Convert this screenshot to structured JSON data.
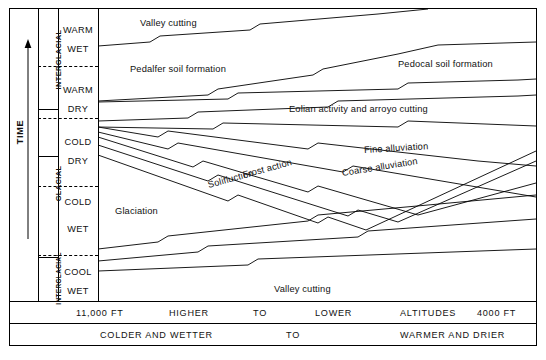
{
  "figure": {
    "vertical_axis_label": "TIME",
    "vertical_axis_direction": "up"
  },
  "time_column": {
    "label": "TIME",
    "arrow_icon": "up-arrow-icon"
  },
  "stage_column": {
    "stages": [
      {
        "label": "INTERGLACIAL",
        "top": 9,
        "height": 100
      },
      {
        "label": "GLACIAL",
        "top": 109,
        "height": 148
      },
      {
        "label": "INTERGLACIAL",
        "top": 257,
        "height": 44
      }
    ]
  },
  "climate_column": {
    "cells": [
      {
        "line1": "WARM",
        "line2": "WET",
        "top": 9,
        "height": 48
      },
      {
        "line1": "WARM",
        "line2": "DRY",
        "top": 57,
        "height": 52
      },
      {
        "line1": "COLD",
        "line2": "DRY",
        "top": 109,
        "height": 47
      },
      {
        "line1": "COLD",
        "line2": "WET",
        "top": 156,
        "height": 77
      },
      {
        "line1": "COOL",
        "line2": "WET",
        "top": 233,
        "height": 68
      }
    ]
  },
  "process_labels": [
    {
      "text": "Valley cutting",
      "x": 140,
      "y": 18,
      "rotate": 0
    },
    {
      "text": "Pedalfer soil formation",
      "x": 130,
      "y": 64,
      "rotate": 0
    },
    {
      "text": "Pedocal soil formation",
      "x": 398,
      "y": 59,
      "rotate": 0
    },
    {
      "text": "Eolian activity and arroyo cutting",
      "x": 289,
      "y": 104,
      "rotate": 0
    },
    {
      "text": "Fine alluviation",
      "x": 364,
      "y": 145,
      "rotate": -3.5
    },
    {
      "text": "Coarse alluviation",
      "x": 342,
      "y": 168,
      "rotate": -9
    },
    {
      "text": "Frost action",
      "x": 243,
      "y": 170,
      "rotate": -15
    },
    {
      "text": "Solifluction",
      "x": 208,
      "y": 180,
      "rotate": -15
    },
    {
      "text": "Glaciation",
      "x": 115,
      "y": 206,
      "rotate": 0
    },
    {
      "text": "Valley cutting",
      "x": 274,
      "y": 284,
      "rotate": 0
    }
  ],
  "altitude_axis": {
    "items": [
      {
        "text": "11,000 FT",
        "x": 76
      },
      {
        "text": "HIGHER",
        "x": 169
      },
      {
        "text": "TO",
        "x": 253
      },
      {
        "text": "LOWER",
        "x": 315
      },
      {
        "text": "ALTITUDES",
        "x": 400
      },
      {
        "text": "4000 FT",
        "x": 490
      }
    ]
  },
  "climate_axis": {
    "items": [
      {
        "text": "COLDER AND WETTER",
        "x": 100
      },
      {
        "text": "TO",
        "x": 286
      },
      {
        "text": "WARMER AND DRIER",
        "x": 400
      }
    ]
  },
  "chart_data": {
    "type": "line",
    "xlabel": "HIGHER TO LOWER ALTITUDES / COLDER AND WETTER TO WARMER AND DRIER",
    "ylabel": "TIME",
    "xlim": [
      "11,000 FT",
      "4000 FT"
    ],
    "grid": false,
    "legend": "none",
    "note": "Time-transgressive boundary lines separating geomorphic process zones; each boundary drawn with zigzag break symbols.",
    "y_categories": [
      "COOL WET (INTERGLACIAL)",
      "COLD WET (GLACIAL)",
      "COLD DRY (GLACIAL)",
      "WARM DRY (INTERGLACIAL)",
      "WARM WET (INTERGLACIAL)"
    ],
    "process_zones": [
      "Valley cutting",
      "Pedalfer soil formation",
      "Pedocal soil formation",
      "Eolian activity and arroyo cutting",
      "Fine alluviation",
      "Coarse alluviation",
      "Frost action",
      "Solifluction",
      "Glaciation"
    ],
    "boundaries": [
      {
        "name": "valley-cutting-lower",
        "points": [
          [
            0,
            37
          ],
          [
            52,
            33
          ],
          [
            62,
            27
          ],
          [
            152,
            21
          ],
          [
            162,
            15
          ],
          [
            280,
            5
          ],
          [
            330,
            0
          ]
        ]
      },
      {
        "name": "pedalfer-pedocal",
        "points": [
          [
            0,
            92
          ],
          [
            110,
            86
          ],
          [
            120,
            80
          ],
          [
            215,
            66
          ],
          [
            225,
            60
          ],
          [
            300,
            45
          ],
          [
            340,
            36
          ],
          [
            438,
            33
          ]
        ]
      },
      {
        "name": "pedalfer-lower",
        "points": [
          [
            0,
            93
          ],
          [
            130,
            90
          ],
          [
            140,
            84
          ],
          [
            300,
            80
          ],
          [
            310,
            74
          ],
          [
            420,
            71
          ],
          [
            438,
            70
          ]
        ]
      },
      {
        "name": "eolian-upper",
        "points": [
          [
            0,
            112
          ],
          [
            90,
            109
          ],
          [
            100,
            103
          ],
          [
            230,
            98
          ],
          [
            240,
            92
          ],
          [
            420,
            87
          ],
          [
            438,
            86
          ]
        ]
      },
      {
        "name": "eolian-lower",
        "points": [
          [
            0,
            118
          ],
          [
            115,
            120
          ],
          [
            125,
            114
          ],
          [
            300,
            118
          ],
          [
            310,
            112
          ],
          [
            438,
            117
          ]
        ]
      },
      {
        "name": "fine-alluviation-upper",
        "points": [
          [
            0,
            118
          ],
          [
            60,
            128
          ],
          [
            70,
            122
          ],
          [
            210,
            140
          ],
          [
            220,
            134
          ],
          [
            380,
            152
          ],
          [
            438,
            157
          ]
        ]
      },
      {
        "name": "fine-alluviation-lower",
        "points": [
          [
            0,
            123
          ],
          [
            70,
            140
          ],
          [
            80,
            134
          ],
          [
            245,
            163
          ],
          [
            255,
            157
          ],
          [
            438,
            188
          ]
        ]
      },
      {
        "name": "coarse-upper",
        "points": [
          [
            0,
            128
          ],
          [
            95,
            158
          ],
          [
            105,
            152
          ],
          [
            210,
            183
          ],
          [
            220,
            177
          ],
          [
            320,
            206
          ],
          [
            438,
            174
          ]
        ]
      },
      {
        "name": "frost-solifluction",
        "points": [
          [
            0,
            136
          ],
          [
            110,
            172
          ],
          [
            120,
            166
          ],
          [
            250,
            207
          ],
          [
            260,
            201
          ],
          [
            300,
            213
          ],
          [
            438,
            152
          ]
        ]
      },
      {
        "name": "glaciation-upper",
        "points": [
          [
            0,
            146
          ],
          [
            130,
            192
          ],
          [
            140,
            186
          ],
          [
            220,
            214
          ],
          [
            230,
            208
          ],
          [
            268,
            221
          ],
          [
            438,
            142
          ]
        ]
      },
      {
        "name": "glaciation-lower",
        "points": [
          [
            0,
            240
          ],
          [
            60,
            233
          ],
          [
            70,
            227
          ],
          [
            210,
            212
          ],
          [
            220,
            206
          ],
          [
            330,
            196
          ],
          [
            438,
            186
          ]
        ]
      },
      {
        "name": "valley-cutting-upper2",
        "points": [
          [
            0,
            252
          ],
          [
            100,
            243
          ],
          [
            110,
            237
          ],
          [
            260,
            228
          ],
          [
            270,
            222
          ],
          [
            438,
            210
          ]
        ]
      },
      {
        "name": "valley-cutting-lower2",
        "points": [
          [
            0,
            262
          ],
          [
            150,
            256
          ],
          [
            160,
            250
          ],
          [
            438,
            240
          ]
        ]
      }
    ]
  }
}
